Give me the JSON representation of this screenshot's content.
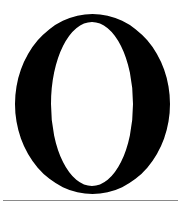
{
  "glyph": {
    "character": "O",
    "style": "serif capital letter",
    "color": "#000000",
    "background": "#ffffff",
    "outer": {
      "cx": 92.5,
      "cy": 104,
      "rx": 77.5,
      "ry": 90
    },
    "inner": {
      "cx": 92,
      "cy": 104,
      "rx": 41,
      "ry": 82
    }
  },
  "rule": {
    "color": "#8a8a8a"
  }
}
